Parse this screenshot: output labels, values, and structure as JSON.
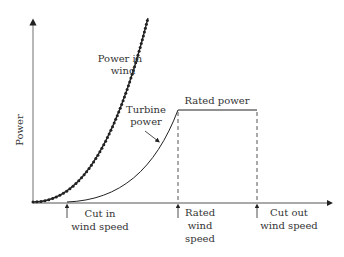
{
  "chart_data": {
    "type": "line",
    "title": "",
    "xlabel": "Wind speed",
    "ylabel": "Power",
    "grid": false,
    "series": [
      {
        "name": "Power in wind",
        "style": "dotted-markers",
        "shape": "cubic"
      },
      {
        "name": "Turbine power",
        "style": "solid",
        "shape": "rises from cut-in to rated, flat at rated power until cut-out"
      }
    ],
    "annotations": [
      {
        "text_lines": [
          "Power in",
          "wind"
        ]
      },
      {
        "text_lines": [
          "Turbine",
          "power"
        ]
      },
      {
        "text": "Rated power"
      },
      {
        "text_lines": [
          "Cut in",
          "wind speed"
        ]
      },
      {
        "text_lines": [
          "Rated",
          "wind",
          "speed"
        ]
      },
      {
        "text_lines": [
          "Cut out",
          "wind speed"
        ]
      }
    ]
  },
  "labels": {
    "y_axis": "Power",
    "power_in_wind_1": "Power in",
    "power_in_wind_2": "wind",
    "turbine_power_1": "Turbine",
    "turbine_power_2": "power",
    "rated_power": "Rated power",
    "cut_in_1": "Cut in",
    "cut_in_2": "wind speed",
    "rated_ws_1": "Rated",
    "rated_ws_2": "wind",
    "rated_ws_3": "speed",
    "cut_out_1": "Cut out",
    "cut_out_2": "wind speed"
  },
  "colors": {
    "axis": "#888888",
    "curve": "#222222",
    "text": "#333333"
  }
}
